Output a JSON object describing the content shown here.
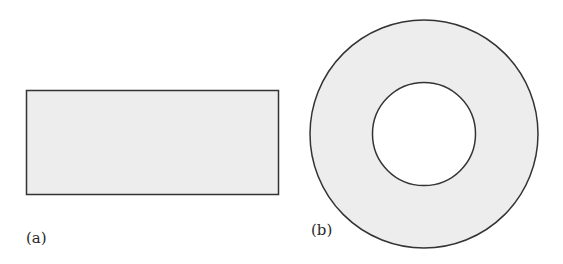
{
  "figure": {
    "panels": [
      {
        "label": "(a)",
        "shape": "rectangle"
      },
      {
        "label": "(b)",
        "shape": "annulus"
      }
    ],
    "colors": {
      "fill": "#ececec",
      "stroke": "#333333",
      "hole": "#ffffff"
    }
  }
}
